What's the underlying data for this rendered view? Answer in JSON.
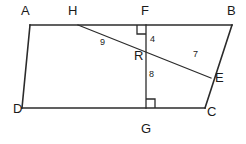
{
  "figure": {
    "background_color": "#ffffff",
    "stroke_color": "#2b2b2b",
    "vertex_labels": [
      {
        "id": "A",
        "text": "A",
        "x": 21,
        "y": 4
      },
      {
        "id": "H",
        "text": "H",
        "x": 68,
        "y": 4
      },
      {
        "id": "F",
        "text": "F",
        "x": 141,
        "y": 4
      },
      {
        "id": "B",
        "text": "B",
        "x": 227,
        "y": 4
      },
      {
        "id": "R",
        "text": "R",
        "x": 134,
        "y": 49
      },
      {
        "id": "E",
        "text": "E",
        "x": 215,
        "y": 71
      },
      {
        "id": "D",
        "text": "D",
        "x": 13,
        "y": 102
      },
      {
        "id": "C",
        "text": "C",
        "x": 207,
        "y": 105
      },
      {
        "id": "G",
        "text": "G",
        "x": 141,
        "y": 122
      }
    ],
    "length_labels": [
      {
        "id": "HR",
        "text": "9",
        "x": 100,
        "y": 38
      },
      {
        "id": "FR",
        "text": "4",
        "x": 150,
        "y": 35
      },
      {
        "id": "RE",
        "text": "7",
        "x": 193,
        "y": 50
      },
      {
        "id": "RG",
        "text": "8",
        "x": 149,
        "y": 70
      }
    ],
    "points": {
      "A": {
        "x": 30,
        "y": 25
      },
      "B": {
        "x": 232,
        "y": 25
      },
      "C": {
        "x": 205,
        "y": 108
      },
      "D": {
        "x": 22,
        "y": 108
      },
      "E": {
        "x": 211,
        "y": 78
      },
      "F": {
        "x": 146,
        "y": 25
      },
      "G": {
        "x": 146,
        "y": 108
      },
      "H": {
        "x": 78,
        "y": 25
      },
      "R": {
        "x": 146,
        "y": 55
      }
    },
    "segments": [
      {
        "id": "AB",
        "from": "A",
        "to": "B",
        "weight": "thick"
      },
      {
        "id": "BC",
        "from": "B",
        "to": "C",
        "weight": "thick"
      },
      {
        "id": "DC",
        "from": "D",
        "to": "C",
        "weight": "thick"
      },
      {
        "id": "AD",
        "from": "A",
        "to": "D",
        "weight": "thick"
      },
      {
        "id": "FG",
        "from": "F",
        "to": "G",
        "weight": "thin"
      },
      {
        "id": "HE",
        "from": "H",
        "to": "E",
        "weight": "thin"
      }
    ],
    "right_angles": [
      {
        "id": "angle-at-F",
        "vertex": "F",
        "size": 9,
        "dir_x": -1,
        "dir_y": 1
      },
      {
        "id": "angle-at-G",
        "vertex": "G",
        "size": 9,
        "dir_x": 1,
        "dir_y": -1
      }
    ]
  }
}
